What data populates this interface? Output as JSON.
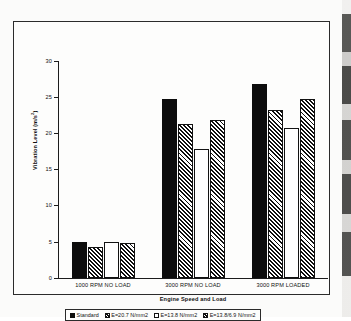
{
  "chart_data": {
    "type": "bar",
    "title": "",
    "xlabel": "Engine Speed and Load",
    "ylabel": "Vibration Level (m/s²)",
    "ylabel_main": "Vibration Level (m/s",
    "ylabel_sup": "2",
    "ylabel_tail": ")",
    "categories": [
      "1000 RPM NO LOAD",
      "3000 RPM NO LOAD",
      "3000 RPM LOADED"
    ],
    "ylim": [
      0,
      30
    ],
    "yticks": [
      0,
      5,
      10,
      15,
      20,
      25,
      30
    ],
    "ytick_labels": [
      "0",
      "5",
      "10",
      "15",
      "20",
      "25",
      "30"
    ],
    "grid": false,
    "legend_position": "bottom",
    "series": [
      {
        "name": "Standard",
        "fill": "solid-black",
        "color": "#0d0d0d",
        "values": [
          5.0,
          24.7,
          26.8
        ]
      },
      {
        "name": "E=20.7 N/mm2",
        "fill": "diagonal-hatch",
        "color": "#0f0f0f",
        "values": [
          4.3,
          21.3,
          23.2
        ]
      },
      {
        "name": "E=13.8 N/mm2",
        "fill": "white",
        "color": "#ffffff",
        "values": [
          5.0,
          17.8,
          20.7
        ]
      },
      {
        "name": "E=13.8/6.9 N/mm2",
        "fill": "diagonal-hatch",
        "color": "#0f0f0f",
        "values": [
          4.8,
          21.8,
          24.7
        ]
      }
    ]
  },
  "legend": {
    "items": [
      {
        "label": "Standard",
        "swatch": "s-standard"
      },
      {
        "label": "E=20.7 N/mm2",
        "swatch": "s-e207"
      },
      {
        "label": "E=13.8 N/mm2",
        "swatch": "s-e138"
      },
      {
        "label": "E=13.8/6.9 N/mm2",
        "swatch": "s-e138-69"
      }
    ]
  }
}
